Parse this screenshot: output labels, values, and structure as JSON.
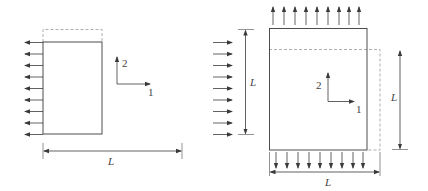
{
  "colors": {
    "line": "#3a3a3a",
    "dashed": "#9a9a9a",
    "text": "#444444",
    "background": "#ffffff"
  },
  "left_figure": {
    "title": "uniaxial-tension-specimen",
    "dimension_label": "L",
    "axis_labels": {
      "axis1": "1",
      "axis2": "2"
    },
    "load_arrow_count": 9,
    "load_direction": "left"
  },
  "right_figure": {
    "title": "biaxial-loaded-square",
    "dimension_labels": {
      "left": "L",
      "right": "L",
      "bottom": "L"
    },
    "axis_labels": {
      "axis1": "1",
      "axis2": "2"
    },
    "top_arrow_count": 9,
    "bottom_arrow_count": 9,
    "left_arrow_count": 9
  }
}
